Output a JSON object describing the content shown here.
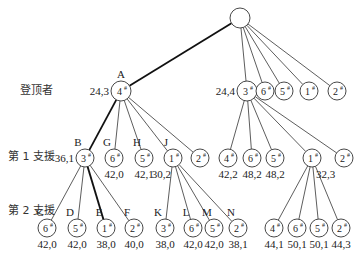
{
  "diagram": {
    "type": "search-tree",
    "row_labels": [
      {
        "text": "登顶者",
        "x": 20,
        "y": 94
      },
      {
        "text": "第 1 支援",
        "x": 8,
        "y": 160
      },
      {
        "text": "第 2 支援",
        "x": 8,
        "y": 214
      }
    ],
    "nodes": [
      {
        "id": "root",
        "x": 240,
        "y": 18,
        "r": 10,
        "num": "",
        "sup": ""
      },
      {
        "id": "A",
        "x": 121,
        "y": 91,
        "r": 10,
        "num": "4",
        "sup": "#",
        "letter": "A",
        "value": "24,3",
        "value_pos": "left"
      },
      {
        "id": "L1b",
        "x": 247,
        "y": 91,
        "r": 10,
        "num": "3",
        "sup": "#",
        "value": "24,4",
        "value_pos": "left"
      },
      {
        "id": "L1c",
        "x": 265,
        "y": 91,
        "r": 9,
        "num": "6",
        "sup": "#"
      },
      {
        "id": "L1d",
        "x": 284,
        "y": 91,
        "r": 9,
        "num": "5",
        "sup": "#"
      },
      {
        "id": "L1e",
        "x": 309,
        "y": 91,
        "r": 9,
        "num": "1",
        "sup": "#"
      },
      {
        "id": "L1f",
        "x": 337,
        "y": 91,
        "r": 9,
        "num": "2",
        "sup": "#"
      },
      {
        "id": "B",
        "x": 85,
        "y": 158,
        "r": 9,
        "num": "3",
        "sup": "#",
        "letter": "B",
        "value": "36,1",
        "value_pos": "left"
      },
      {
        "id": "G",
        "x": 114,
        "y": 158,
        "r": 9,
        "num": "6",
        "sup": "#",
        "letter": "G",
        "value": "42,0",
        "value_pos": "below"
      },
      {
        "id": "H",
        "x": 144,
        "y": 158,
        "r": 9,
        "num": "5",
        "sup": "#",
        "letter": "H",
        "value": "42,1",
        "value_pos": "below"
      },
      {
        "id": "J",
        "x": 173,
        "y": 158,
        "r": 9,
        "num": "1",
        "sup": "#",
        "letter": "J",
        "value": "30,2",
        "value_pos": "below-left"
      },
      {
        "id": "A2",
        "x": 200,
        "y": 158,
        "r": 9,
        "num": "2",
        "sup": "#"
      },
      {
        "id": "P4",
        "x": 228,
        "y": 158,
        "r": 9,
        "num": "4",
        "sup": "#",
        "value": "42,2",
        "value_pos": "below"
      },
      {
        "id": "P6",
        "x": 252,
        "y": 158,
        "r": 9,
        "num": "6",
        "sup": "#",
        "value": "48,2",
        "value_pos": "below"
      },
      {
        "id": "P5",
        "x": 275,
        "y": 158,
        "r": 9,
        "num": "5",
        "sup": "#",
        "value": "48,2",
        "value_pos": "below"
      },
      {
        "id": "P1",
        "x": 312,
        "y": 158,
        "r": 9,
        "num": "1",
        "sup": "#",
        "value": "32,3",
        "value_pos": "below-right"
      },
      {
        "id": "P2",
        "x": 344,
        "y": 158,
        "r": 9,
        "num": "2",
        "sup": "#"
      },
      {
        "id": "C",
        "x": 47,
        "y": 228,
        "r": 9,
        "num": "6",
        "sup": "#",
        "letter": "C",
        "value": "42,0"
      },
      {
        "id": "D",
        "x": 77,
        "y": 228,
        "r": 9,
        "num": "5",
        "sup": "#",
        "letter": "D",
        "value": "42,0"
      },
      {
        "id": "E",
        "x": 106,
        "y": 228,
        "r": 9,
        "num": "1",
        "sup": "#",
        "letter": "E",
        "value": "38,0"
      },
      {
        "id": "F",
        "x": 134,
        "y": 228,
        "r": 9,
        "num": "2",
        "sup": "#",
        "letter": "F",
        "value": "40,0"
      },
      {
        "id": "K",
        "x": 165,
        "y": 228,
        "r": 9,
        "num": "3",
        "sup": "#",
        "letter": "K",
        "value": "38,0"
      },
      {
        "id": "L",
        "x": 193,
        "y": 228,
        "r": 9,
        "num": "6",
        "sup": "#",
        "letter": "L",
        "value": "42,0"
      },
      {
        "id": "M",
        "x": 214,
        "y": 228,
        "r": 9,
        "num": "5",
        "sup": "#",
        "letter": "M",
        "value": "42,0"
      },
      {
        "id": "N",
        "x": 238,
        "y": 228,
        "r": 9,
        "num": "2",
        "sup": "#",
        "letter": "N",
        "value": "38,1"
      },
      {
        "id": "Q4",
        "x": 274,
        "y": 228,
        "r": 9,
        "num": "4",
        "sup": "#",
        "value": "44,1"
      },
      {
        "id": "Q6",
        "x": 297,
        "y": 228,
        "r": 9,
        "num": "6",
        "sup": "#",
        "value": "50,1"
      },
      {
        "id": "Q5",
        "x": 319,
        "y": 228,
        "r": 9,
        "num": "5",
        "sup": "#",
        "value": "50,1"
      },
      {
        "id": "Q2",
        "x": 341,
        "y": 228,
        "r": 9,
        "num": "2",
        "sup": "#",
        "value": "44,3"
      }
    ],
    "edges": [
      {
        "from": "root",
        "to": "A",
        "bold": true
      },
      {
        "from": "root",
        "to": "L1b"
      },
      {
        "from": "root",
        "to": "L1c"
      },
      {
        "from": "root",
        "to": "L1d"
      },
      {
        "from": "root",
        "to": "L1e"
      },
      {
        "from": "root",
        "to": "L1f"
      },
      {
        "from": "A",
        "to": "B",
        "bold": true
      },
      {
        "from": "A",
        "to": "G"
      },
      {
        "from": "A",
        "to": "H"
      },
      {
        "from": "A",
        "to": "J"
      },
      {
        "from": "A",
        "to": "A2"
      },
      {
        "from": "L1b",
        "to": "P4"
      },
      {
        "from": "L1b",
        "to": "P6"
      },
      {
        "from": "L1b",
        "to": "P5"
      },
      {
        "from": "L1b",
        "to": "P1"
      },
      {
        "from": "L1b",
        "to": "P2"
      },
      {
        "from": "B",
        "to": "C"
      },
      {
        "from": "B",
        "to": "D"
      },
      {
        "from": "B",
        "to": "E",
        "bold": true
      },
      {
        "from": "B",
        "to": "F"
      },
      {
        "from": "J",
        "to": "K"
      },
      {
        "from": "J",
        "to": "L"
      },
      {
        "from": "J",
        "to": "M"
      },
      {
        "from": "J",
        "to": "N"
      },
      {
        "from": "P1",
        "to": "Q4"
      },
      {
        "from": "P1",
        "to": "Q6"
      },
      {
        "from": "P1",
        "to": "Q5"
      },
      {
        "from": "P1",
        "to": "Q2"
      }
    ]
  }
}
